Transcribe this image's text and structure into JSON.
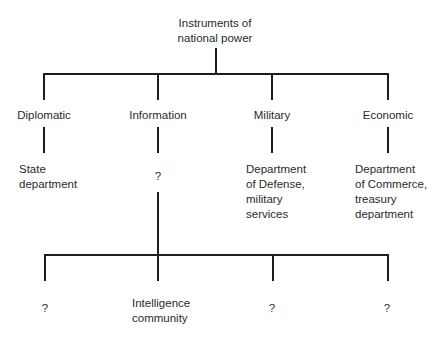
{
  "root": {
    "line1": "Instruments of",
    "line2": "national power"
  },
  "instruments": [
    {
      "name": "Diplomatic",
      "agency": [
        "State",
        "department"
      ]
    },
    {
      "name": "Information",
      "agency": [
        "?"
      ]
    },
    {
      "name": "Military",
      "agency": [
        "Department",
        "of Defense,",
        "military",
        "services"
      ]
    },
    {
      "name": "Economic",
      "agency": [
        "Department",
        "of Commerce,",
        "treasury",
        "department"
      ]
    }
  ],
  "information_subagencies": [
    {
      "label": [
        "?"
      ]
    },
    {
      "label": [
        "Intelligence",
        "community"
      ]
    },
    {
      "label": [
        "?"
      ]
    },
    {
      "label": [
        "?"
      ]
    }
  ]
}
